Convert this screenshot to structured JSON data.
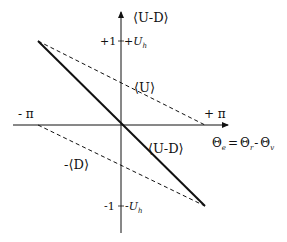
{
  "diagram": {
    "type": "phase-detector characteristic",
    "y_axis": {
      "label": "⟨U-D⟩",
      "top_ticks": {
        "left": "+1",
        "right_prefix": "+",
        "right_var": "U",
        "right_sub": "h"
      },
      "bottom_ticks": {
        "left": "-1",
        "right_prefix": "-",
        "right_var": "U",
        "right_sub": "h"
      }
    },
    "x_axis": {
      "left_label": "- π",
      "right_label": "+ π",
      "formula": {
        "lhs": "Θ",
        "lhs_sub": "e",
        "eq": "=",
        "t1": "Θ",
        "t1_sub": "r",
        "minus": "-",
        "t2": "Θ",
        "t2_sub": "v"
      }
    },
    "curves": {
      "u_label": "⟨U⟩",
      "d_label": "-⟨D⟩",
      "ud_label": "⟨U-D⟩"
    },
    "colors": {
      "ink": "#111111",
      "background": "#ffffff"
    }
  }
}
